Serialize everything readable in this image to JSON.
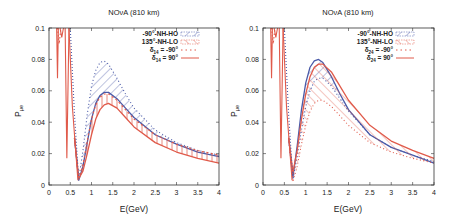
{
  "chart_data": [
    {
      "type": "line",
      "title": "NOνA (810 km)",
      "xlabel": "E(GeV)",
      "ylabel": "Pμe",
      "xlim": [
        0,
        4
      ],
      "ylim": [
        0,
        0.1
      ],
      "xticks": [
        "0",
        "0.5",
        "1",
        "1.5",
        "2",
        "2.5",
        "3",
        "3.5",
        "4"
      ],
      "yticks": [
        "0",
        "0.02",
        "0.04",
        "0.06",
        "0.08",
        "0.1"
      ],
      "legend": [
        "-90°-NH-HO",
        "135°-NH-LO",
        "δ14 = -90°",
        "δ14 = 90°"
      ],
      "legend_position": "upper right",
      "grid": false,
      "bands": [
        {
          "name": "-90°-NH-HO",
          "color": "#4a5aa8",
          "upper": {
            "style": "dotted",
            "x": [
              0.6,
              0.7,
              0.8,
              0.9,
              1.0,
              1.1,
              1.2,
              1.3,
              1.4,
              1.6,
              1.8,
              2.0,
              2.5,
              3.0,
              3.5,
              4.0
            ],
            "y": [
              0.03,
              0.004,
              0.022,
              0.045,
              0.063,
              0.073,
              0.078,
              0.079,
              0.077,
              0.068,
              0.058,
              0.049,
              0.035,
              0.027,
              0.022,
              0.019
            ]
          },
          "lower": {
            "style": "solid",
            "x": [
              0.6,
              0.7,
              0.8,
              0.9,
              1.0,
              1.1,
              1.2,
              1.3,
              1.4,
              1.6,
              1.8,
              2.0,
              2.5,
              3.0,
              3.5,
              4.0
            ],
            "y": [
              0.03,
              0.003,
              0.012,
              0.027,
              0.042,
              0.052,
              0.057,
              0.059,
              0.059,
              0.055,
              0.049,
              0.043,
              0.032,
              0.026,
              0.021,
              0.018
            ]
          }
        },
        {
          "name": "135°-NH-LO",
          "color": "#e05a4a",
          "upper": {
            "style": "dashed",
            "x": [
              0.6,
              0.7,
              0.8,
              0.9,
              1.0,
              1.1,
              1.2,
              1.3,
              1.4,
              1.6,
              1.8,
              2.0,
              2.5,
              3.0,
              3.5,
              4.0
            ],
            "y": [
              0.03,
              0.004,
              0.013,
              0.028,
              0.042,
              0.051,
              0.056,
              0.058,
              0.058,
              0.054,
              0.048,
              0.042,
              0.032,
              0.026,
              0.022,
              0.019
            ]
          },
          "lower": {
            "style": "solid",
            "x": [
              0.6,
              0.7,
              0.8,
              0.9,
              1.0,
              1.1,
              1.2,
              1.3,
              1.4,
              1.6,
              1.8,
              2.0,
              2.5,
              3.0,
              3.5,
              4.0
            ],
            "y": [
              0.03,
              0.004,
              0.009,
              0.02,
              0.032,
              0.042,
              0.048,
              0.051,
              0.052,
              0.049,
              0.043,
              0.037,
              0.027,
              0.021,
              0.017,
              0.014
            ]
          }
        }
      ]
    },
    {
      "type": "line",
      "title": "NOνA (810 km)",
      "xlabel": "E(GeV)",
      "ylabel": "Pμe",
      "xlim": [
        0,
        4
      ],
      "ylim": [
        0,
        0.1
      ],
      "xticks": [
        "0",
        "0.5",
        "1",
        "1.5",
        "2",
        "2.5",
        "3",
        "3.5",
        "4"
      ],
      "yticks": [
        "0",
        "0.02",
        "0.04",
        "0.06",
        "0.08",
        "0.1"
      ],
      "legend": [
        "-90°-NH-HO",
        "135°-NH-LO",
        "δ24 = -90°",
        "δ24 = 90°"
      ],
      "legend_position": "upper right",
      "grid": false,
      "bands": [
        {
          "name": "-90°-NH-HO",
          "color": "#4a5aa8",
          "upper": {
            "style": "solid",
            "x": [
              0.6,
              0.7,
              0.8,
              0.9,
              1.0,
              1.1,
              1.2,
              1.3,
              1.4,
              1.6,
              1.8,
              2.0,
              2.5,
              3.0,
              3.5,
              4.0
            ],
            "y": [
              0.03,
              0.005,
              0.025,
              0.048,
              0.065,
              0.075,
              0.079,
              0.08,
              0.078,
              0.069,
              0.058,
              0.048,
              0.032,
              0.024,
              0.019,
              0.014
            ]
          },
          "lower": {
            "style": "dotted",
            "x": [
              0.6,
              0.7,
              0.8,
              0.9,
              1.0,
              1.1,
              1.2,
              1.3,
              1.4,
              1.6,
              1.8,
              2.0,
              2.5,
              3.0,
              3.5,
              4.0
            ],
            "y": [
              0.03,
              0.004,
              0.018,
              0.035,
              0.05,
              0.06,
              0.066,
              0.068,
              0.068,
              0.063,
              0.055,
              0.047,
              0.032,
              0.024,
              0.019,
              0.015
            ]
          }
        },
        {
          "name": "135°-NH-LO",
          "color": "#e05a4a",
          "upper": {
            "style": "solid",
            "x": [
              0.6,
              0.7,
              0.8,
              0.9,
              1.0,
              1.1,
              1.2,
              1.3,
              1.4,
              1.6,
              1.8,
              2.0,
              2.5,
              3.0,
              3.5,
              4.0
            ],
            "y": [
              0.03,
              0.008,
              0.022,
              0.042,
              0.058,
              0.069,
              0.075,
              0.077,
              0.077,
              0.072,
              0.063,
              0.054,
              0.038,
              0.028,
              0.022,
              0.017
            ]
          },
          "lower": {
            "style": "dotted",
            "x": [
              0.6,
              0.7,
              0.8,
              0.9,
              1.0,
              1.1,
              1.2,
              1.3,
              1.4,
              1.6,
              1.8,
              2.0,
              2.5,
              3.0,
              3.5,
              4.0
            ],
            "y": [
              0.03,
              0.002,
              0.012,
              0.026,
              0.038,
              0.047,
              0.052,
              0.054,
              0.054,
              0.05,
              0.044,
              0.038,
              0.027,
              0.021,
              0.017,
              0.014
            ]
          }
        }
      ]
    }
  ],
  "plots": [
    {
      "title": "NOνA (810 km)",
      "xlabel": "E(GeV)",
      "ylabel_main": "P",
      "ylabel_sub": "μe",
      "legend": [
        {
          "label": "-90°-NH-HO",
          "sub": ""
        },
        {
          "label": "135°-NH-LO",
          "sub": ""
        },
        {
          "pre": "δ",
          "sub": "14",
          "post": " = -90°"
        },
        {
          "pre": "δ",
          "sub": "14",
          "post": " = 90°"
        }
      ]
    },
    {
      "title": "NOνA (810 km)",
      "xlabel": "E(GeV)",
      "ylabel_main": "P",
      "ylabel_sub": "μe",
      "legend": [
        {
          "label": "-90°-NH-HO",
          "sub": ""
        },
        {
          "label": "135°-NH-LO",
          "sub": ""
        },
        {
          "pre": "δ",
          "sub": "24",
          "post": " = -90°"
        },
        {
          "pre": "δ",
          "sub": "24",
          "post": " = 90°"
        }
      ]
    }
  ],
  "colors": {
    "blue": "#4a5aa8",
    "red": "#e05a4a",
    "axis": "#333333"
  }
}
